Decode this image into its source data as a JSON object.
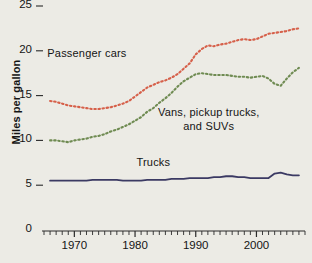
{
  "chart_data": {
    "type": "line",
    "title": "",
    "subtitle": "",
    "xlabel": "",
    "ylabel": "Miles per gallon",
    "xlim": [
      1965,
      2008
    ],
    "ylim": [
      0,
      26
    ],
    "grid": false,
    "legend_position": "inline-annotations",
    "y_ticks": [
      0,
      5,
      10,
      15,
      20,
      25
    ],
    "y_tick_labels": [
      "0",
      "5",
      "10",
      "15",
      "20",
      "25"
    ],
    "x_ticks": [
      1970,
      1980,
      1990,
      2000
    ],
    "x_tick_labels": [
      "1970",
      "1980",
      "1990",
      "2000"
    ],
    "x_minor_tick_interval": 1,
    "series": [
      {
        "name": "Passenger cars",
        "color": "#d6604a",
        "style": "dotted",
        "label_x": 1972,
        "label_y": 19.6,
        "x": [
          1966,
          1967,
          1968,
          1969,
          1970,
          1971,
          1972,
          1973,
          1974,
          1975,
          1976,
          1977,
          1978,
          1979,
          1980,
          1981,
          1982,
          1983,
          1984,
          1985,
          1986,
          1987,
          1988,
          1989,
          1990,
          1991,
          1992,
          1993,
          1994,
          1995,
          1996,
          1997,
          1998,
          1999,
          2000,
          2001,
          2002,
          2003,
          2004,
          2005,
          2006,
          2007
        ],
        "values": [
          14.4,
          14.3,
          14.1,
          13.9,
          13.8,
          13.7,
          13.6,
          13.5,
          13.5,
          13.6,
          13.7,
          13.9,
          14.1,
          14.4,
          14.9,
          15.4,
          15.9,
          16.2,
          16.5,
          16.7,
          17.0,
          17.4,
          18.0,
          18.6,
          19.6,
          20.2,
          20.6,
          20.5,
          20.7,
          20.8,
          21.0,
          21.2,
          21.3,
          21.2,
          21.3,
          21.6,
          21.9,
          22.0,
          22.1,
          22.2,
          22.4,
          22.5
        ]
      },
      {
        "name": "Vans, pickup trucks, and SUVs",
        "color": "#6f8b52",
        "style": "dotted",
        "label_x": 1993,
        "label_y": 13.2,
        "x": [
          1966,
          1967,
          1968,
          1969,
          1970,
          1971,
          1972,
          1973,
          1974,
          1975,
          1976,
          1977,
          1978,
          1979,
          1980,
          1981,
          1982,
          1983,
          1984,
          1985,
          1986,
          1987,
          1988,
          1989,
          1990,
          1991,
          1992,
          1993,
          1994,
          1995,
          1996,
          1997,
          1998,
          1999,
          2000,
          2001,
          2002,
          2003,
          2004,
          2005,
          2006,
          2007
        ],
        "values": [
          10.0,
          10.0,
          9.9,
          9.8,
          10.0,
          10.1,
          10.2,
          10.4,
          10.5,
          10.7,
          11.0,
          11.2,
          11.5,
          11.8,
          12.2,
          12.6,
          13.2,
          13.6,
          14.2,
          14.7,
          15.3,
          16.0,
          16.6,
          17.0,
          17.4,
          17.5,
          17.4,
          17.3,
          17.3,
          17.3,
          17.2,
          17.1,
          17.1,
          17.0,
          17.1,
          17.2,
          16.9,
          16.3,
          16.1,
          16.9,
          17.6,
          18.1
        ]
      },
      {
        "name": "Trucks",
        "color": "#3b3a63",
        "style": "solid",
        "label_x": 1983,
        "label_y": 7.5,
        "x": [
          1966,
          1967,
          1968,
          1969,
          1970,
          1971,
          1972,
          1973,
          1974,
          1975,
          1976,
          1977,
          1978,
          1979,
          1980,
          1981,
          1982,
          1983,
          1984,
          1985,
          1986,
          1987,
          1988,
          1989,
          1990,
          1991,
          1992,
          1993,
          1994,
          1995,
          1996,
          1997,
          1998,
          1999,
          2000,
          2001,
          2002,
          2003,
          2004,
          2005,
          2006,
          2007
        ],
        "values": [
          5.5,
          5.5,
          5.5,
          5.5,
          5.5,
          5.5,
          5.5,
          5.6,
          5.6,
          5.6,
          5.6,
          5.6,
          5.5,
          5.5,
          5.5,
          5.5,
          5.6,
          5.6,
          5.6,
          5.6,
          5.7,
          5.7,
          5.7,
          5.8,
          5.8,
          5.8,
          5.8,
          5.9,
          5.9,
          6.0,
          6.0,
          5.9,
          5.9,
          5.8,
          5.8,
          5.8,
          5.8,
          6.3,
          6.4,
          6.2,
          6.1,
          6.1
        ]
      }
    ]
  },
  "axis": {
    "y_title": "Miles per gallon"
  }
}
